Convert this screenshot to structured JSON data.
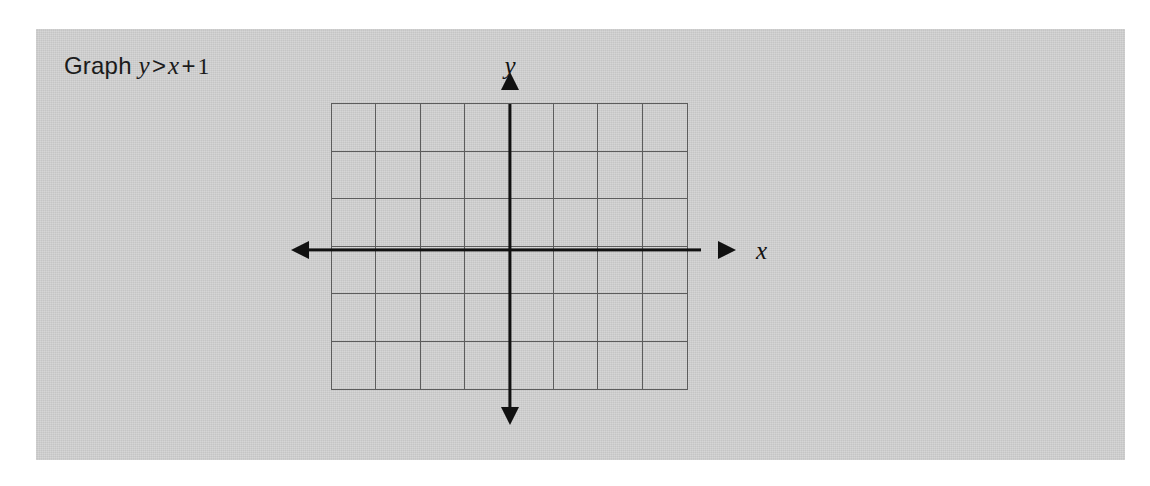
{
  "panel": {
    "background_color": "#d2d2d2"
  },
  "prompt": {
    "lead": "Graph",
    "left_variable": "y",
    "relation": ">",
    "right_variable": "x",
    "operator": "+",
    "constant": "1",
    "full_text": "Graph y > x + 1"
  },
  "graph": {
    "x_axis_label": "x",
    "y_axis_label": "y",
    "axis_color": "#111111",
    "grid_line_color": "#5c5c5c",
    "columns": 8,
    "rows": 6,
    "x_axis_row_index": 3,
    "y_axis_column_index": 4,
    "arrows": {
      "left": "arrow-left",
      "right": "arrow-right",
      "up": "arrow-up",
      "down": "arrow-down"
    }
  },
  "chart_data": {
    "type": "scatter",
    "xlabel": "x",
    "ylabel": "y",
    "grid": true,
    "legend": false,
    "xlim": [
      -4,
      4
    ],
    "ylim": [
      -3,
      3
    ],
    "xticks": [
      -4,
      -3,
      -2,
      -1,
      0,
      1,
      2,
      3,
      4
    ],
    "yticks": [
      -3,
      -2,
      -1,
      0,
      1,
      2,
      3
    ],
    "tick_labels_shown": false,
    "series": [],
    "annotations": [
      "Graph y > x + 1"
    ]
  }
}
